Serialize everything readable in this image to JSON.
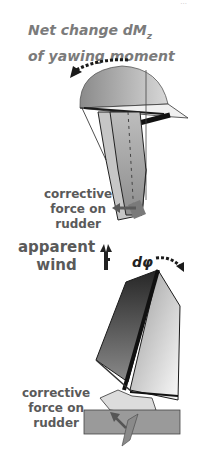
{
  "corner_mark": "···",
  "title": {
    "line1": "Net change dM",
    "line1_sub": "z",
    "line2": "of yawing moment"
  },
  "labels": {
    "top_rudder_force": [
      "corrective",
      "force on",
      "rudder"
    ],
    "apparent_wind": [
      "apparent",
      "wind"
    ],
    "heel_angle": "dφ",
    "bottom_rudder_force": [
      "corrective",
      "force on",
      "rudder"
    ]
  },
  "colors": {
    "text": "#5a5a5a",
    "title": "#7b7b7b",
    "sail_dark": "#2e2e2e",
    "sail_light": "#f2f2f2",
    "hull_grey": "#9a9a9a"
  }
}
